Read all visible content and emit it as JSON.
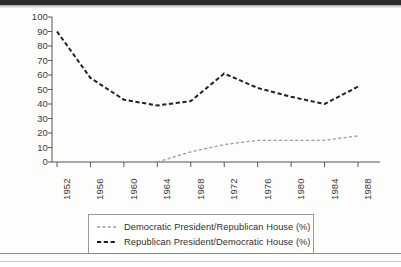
{
  "chart_data": {
    "type": "line",
    "title": "",
    "xlabel": "",
    "ylabel": "",
    "categories": [
      "1952",
      "1956",
      "1960",
      "1964",
      "1968",
      "1972",
      "1976",
      "1980",
      "1984",
      "1988"
    ],
    "ylim": [
      0,
      100
    ],
    "yticks": [
      "0",
      "10",
      "20",
      "30",
      "40",
      "50",
      "60",
      "70",
      "80",
      "90",
      "100"
    ],
    "grid": false,
    "legend_position": "bottom",
    "series": [
      {
        "name": "Democratic President/Republican House (%)",
        "style": "dashed-light",
        "color": "#9a9a9a",
        "x": [
          "1964",
          "1968",
          "1972",
          "1976",
          "1980",
          "1984",
          "1988"
        ],
        "values": [
          0,
          7,
          12,
          15,
          15,
          15,
          18
        ]
      },
      {
        "name": "Republican President/Democratic House (%)",
        "style": "dashed-dark",
        "color": "#222222",
        "x": [
          "1952",
          "1956",
          "1960",
          "1964",
          "1968",
          "1972",
          "1976",
          "1980",
          "1984",
          "1988"
        ],
        "values": [
          90,
          58,
          43,
          39,
          42,
          61,
          51,
          45,
          40,
          52
        ]
      }
    ]
  },
  "legend": {
    "entries": [
      {
        "label": "Democratic President/Republican House (%)"
      },
      {
        "label": "Republican President/Democratic House (%)"
      }
    ]
  }
}
